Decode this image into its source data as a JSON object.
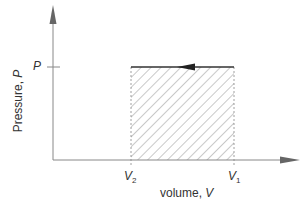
{
  "diagram": {
    "type": "P-V diagram",
    "y_axis_label": "Pressure, ",
    "y_axis_symbol": "P",
    "x_axis_label": "volume, ",
    "x_axis_symbol": "V",
    "p_tick_label": "P",
    "v2_label": "V",
    "v2_sub": "2",
    "v1_label": "V",
    "v1_sub": "1",
    "process": "isobaric compression from V1 to V2 at constant P",
    "arrow_direction": "left",
    "shaded_region": "work area under line between V2 and V1",
    "colors": {
      "axis": "#888888",
      "line": "#333333",
      "hatch": "#777777"
    }
  }
}
